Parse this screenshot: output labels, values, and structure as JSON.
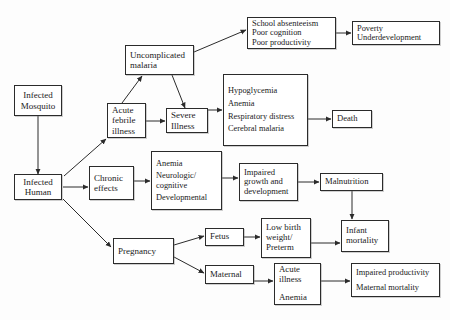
{
  "diagram": {
    "background_color": "#fdfdfd",
    "box_border_color": "#2b2b2b",
    "arrow_color": "#2b2b2b",
    "text_color": "#1a1a1a",
    "nodes": [
      {
        "id": "infected-mosquito",
        "lines": [
          "Infected",
          "Mosquito"
        ]
      },
      {
        "id": "infected-human",
        "lines": [
          "Infected",
          "Human"
        ]
      },
      {
        "id": "acute-febrile",
        "lines": [
          "Acute",
          "febrile",
          "illness"
        ]
      },
      {
        "id": "uncomplicated",
        "lines": [
          "Uncomplicated",
          "malaria"
        ]
      },
      {
        "id": "severe-illness",
        "lines": [
          "Severe",
          "Illness"
        ]
      },
      {
        "id": "school-absenteeism",
        "lines": [
          "School absenteeism",
          "Poor cognition",
          "Poor productivity"
        ]
      },
      {
        "id": "poverty",
        "lines": [
          "Poverty",
          "Underdevelopment"
        ]
      },
      {
        "id": "severe-symptoms",
        "lines": [
          "Hypoglycemia",
          "Anemia",
          "Respiratory distress",
          "Cerebral malaria"
        ]
      },
      {
        "id": "death",
        "lines": [
          "Death"
        ]
      },
      {
        "id": "chronic-effects",
        "lines": [
          "Chronic",
          "effects"
        ]
      },
      {
        "id": "chronic-symptoms",
        "lines": [
          "Anemia",
          "Neurologic/",
          "cognitive",
          "Developmental"
        ]
      },
      {
        "id": "impaired-growth",
        "lines": [
          "Impaired",
          "growth and",
          "development"
        ]
      },
      {
        "id": "malnutrition",
        "lines": [
          "Malnutrition"
        ]
      },
      {
        "id": "pregnancy",
        "lines": [
          "Pregnancy"
        ]
      },
      {
        "id": "fetus",
        "lines": [
          "Fetus"
        ]
      },
      {
        "id": "maternal",
        "lines": [
          "Maternal"
        ]
      },
      {
        "id": "low-birth-weight",
        "lines": [
          "Low birth",
          "weight/",
          "Preterm"
        ]
      },
      {
        "id": "infant-mortality",
        "lines": [
          "Infant",
          "mortality"
        ]
      },
      {
        "id": "acute-illness-anemia",
        "lines": [
          "Acute",
          "illness",
          "Anemia"
        ]
      },
      {
        "id": "maternal-outcomes",
        "lines": [
          "Impaired productivity",
          "Maternal mortality"
        ]
      }
    ],
    "edges": [
      {
        "from": "infected-mosquito",
        "to": "infected-human"
      },
      {
        "from": "infected-human",
        "to": "acute-febrile"
      },
      {
        "from": "infected-human",
        "to": "chronic-effects"
      },
      {
        "from": "infected-human",
        "to": "pregnancy"
      },
      {
        "from": "acute-febrile",
        "to": "uncomplicated"
      },
      {
        "from": "acute-febrile",
        "to": "severe-illness"
      },
      {
        "from": "uncomplicated",
        "to": "severe-illness"
      },
      {
        "from": "uncomplicated",
        "to": "school-absenteeism"
      },
      {
        "from": "school-absenteeism",
        "to": "poverty"
      },
      {
        "from": "severe-illness",
        "to": "severe-symptoms"
      },
      {
        "from": "severe-symptoms",
        "to": "death"
      },
      {
        "from": "chronic-effects",
        "to": "chronic-symptoms"
      },
      {
        "from": "chronic-symptoms",
        "to": "impaired-growth"
      },
      {
        "from": "impaired-growth",
        "to": "malnutrition"
      },
      {
        "from": "malnutrition",
        "to": "infant-mortality"
      },
      {
        "from": "pregnancy",
        "to": "fetus"
      },
      {
        "from": "pregnancy",
        "to": "maternal"
      },
      {
        "from": "fetus",
        "to": "low-birth-weight"
      },
      {
        "from": "low-birth-weight",
        "to": "infant-mortality"
      },
      {
        "from": "maternal",
        "to": "acute-illness-anemia"
      },
      {
        "from": "acute-illness-anemia",
        "to": "maternal-outcomes"
      }
    ]
  }
}
